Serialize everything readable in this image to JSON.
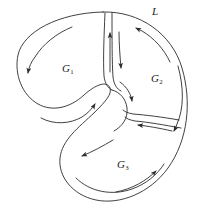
{
  "figure": {
    "stroke_color": "#2b2b2b",
    "background_color": "#ffffff",
    "labels": {
      "boundary": {
        "base": "L",
        "sub": ""
      },
      "region1": {
        "base": "G",
        "sub": "1"
      },
      "region2": {
        "base": "G",
        "sub": "2"
      },
      "region3": {
        "base": "G",
        "sub": "3"
      }
    },
    "regions": [
      {
        "id": "G1",
        "label": "G1",
        "label_x": 68,
        "label_y": 70
      },
      {
        "id": "G2",
        "label": "G2",
        "label_x": 157,
        "label_y": 80
      },
      {
        "id": "G3",
        "label": "G3",
        "label_x": 123,
        "label_y": 166
      }
    ],
    "arrow_count": 9,
    "slit_count": 2
  }
}
